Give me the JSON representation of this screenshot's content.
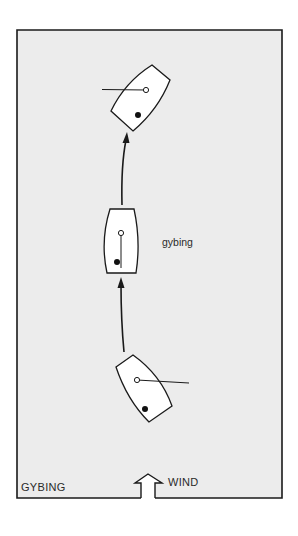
{
  "title": "GYBING",
  "wind_label": "WIND",
  "maneuver_label": "gybing",
  "colors": {
    "page_background": "#ffffff",
    "panel_background": "#ececec",
    "stroke": "#1a1a1a",
    "hull_fill": "#ffffff"
  },
  "boats": [
    {
      "position": "top",
      "heading": "north-east, boom to port after gybe",
      "mast": "open circle",
      "crew": "filled dot"
    },
    {
      "position": "middle",
      "heading": "dead downwind, boom centred (gybing)",
      "mast": "open circle",
      "crew": "filled dot"
    },
    {
      "position": "bottom",
      "heading": "north-west, boom to starboard before gybe",
      "mast": "open circle",
      "crew": "filled dot"
    }
  ],
  "path": [
    "bottom boat",
    "middle boat",
    "top boat"
  ]
}
